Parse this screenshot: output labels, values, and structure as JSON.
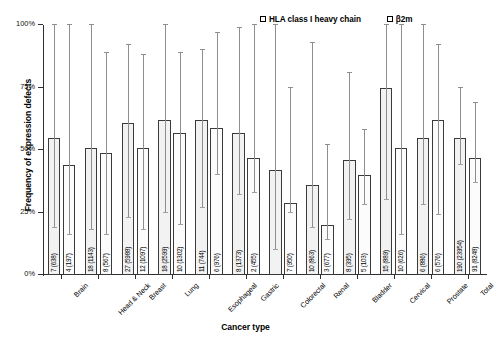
{
  "chart_data": {
    "type": "bar",
    "title": "",
    "xlabel": "Cancer type",
    "ylabel": "Frequency of expression defects",
    "ylim": [
      0,
      100
    ],
    "yticks": [
      "0%",
      "25%",
      "50%",
      "75%",
      "100%"
    ],
    "ytick_values": [
      0,
      25,
      50,
      75,
      100
    ],
    "grid": false,
    "legend_position": "top-right",
    "categories": [
      "Brain",
      "Head & Neck",
      "Breast",
      "Lung",
      "Esophageal",
      "Gastric",
      "Colorectal",
      "Renal",
      "Bladder",
      "Cervical",
      "Prostate",
      "Total"
    ],
    "series": [
      {
        "name": "HLA class I heavy chain",
        "values": [
          55,
          51,
          61,
          62,
          62,
          57,
          42,
          36,
          46,
          75,
          55,
          55
        ],
        "point_labels": [
          "7 (638)",
          "18 (1143)",
          "27 (5988)",
          "18 (2599)",
          "11 (744)",
          "8 (1373)",
          "",
          "10 (863)",
          "8 (395)",
          "15 (889)",
          "6 (886)",
          "190 (23954)"
        ],
        "err_low": [
          19,
          18,
          23,
          25,
          27,
          32,
          10,
          19,
          22,
          30,
          28,
          44
        ],
        "err_high": [
          100,
          100,
          92,
          100,
          90,
          99,
          100,
          93,
          81,
          100,
          100,
          75
        ]
      },
      {
        "name": "β2m",
        "values": [
          44,
          49,
          51,
          57,
          59,
          47,
          29,
          20,
          40,
          51,
          62,
          47
        ],
        "point_labels": [
          "4 (197)",
          "8 (567)",
          "12 (1097)",
          "10 (1302)",
          "6 (976)",
          "2 (455)",
          "7 (950)",
          "3 (677)",
          "5 (103)",
          "10 (626)",
          "6 (576)",
          "91 (8248)"
        ],
        "err_low": [
          16,
          16,
          18,
          20,
          40,
          33,
          25,
          14,
          28,
          16,
          24,
          37
        ],
        "err_high": [
          100,
          89,
          88,
          89,
          97,
          100,
          75,
          52,
          58,
          100,
          92,
          69
        ]
      }
    ]
  },
  "legend": {
    "entries": [
      {
        "label": "HLA class I heavy chain",
        "swatch": "legend-swatch-hla"
      },
      {
        "label": "β2m",
        "swatch": "legend-swatch-b2m"
      }
    ]
  },
  "axes": {
    "ylabel": "Frequency of expression defects",
    "xlabel": "Cancer type"
  }
}
